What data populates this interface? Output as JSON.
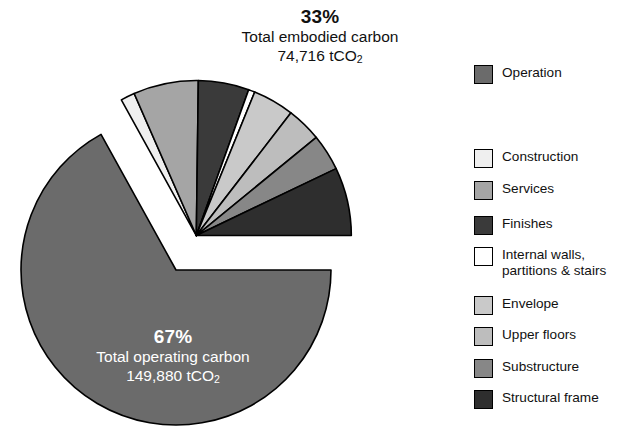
{
  "chart_data": {
    "type": "pie",
    "title": "",
    "subtitle": "",
    "xlabel": "",
    "ylabel": "",
    "grid": false,
    "legend_position": "right",
    "units": "tCO2",
    "groups": [
      {
        "name": "Total operating carbon",
        "percent_label": "67%",
        "percent": 67,
        "value_label": "149,880 tCO₂",
        "value": 149880,
        "exploded": false,
        "categories": [
          "Operation"
        ],
        "values": [
          149880
        ]
      },
      {
        "name": "Total embodied carbon",
        "percent_label": "33%",
        "percent": 33,
        "value_label": "74,716 tCO₂",
        "value": 74716,
        "exploded": true,
        "categories": [
          "Construction",
          "Services",
          "Finishes",
          "Internal walls, partitions & stairs",
          "Envelope",
          "Upper floors",
          "Substructure",
          "Structural frame"
        ],
        "values": [
          4.5,
          20.5,
          16.0,
          2.0,
          13.0,
          11.0,
          11.5,
          21.5
        ]
      }
    ],
    "slices": [
      {
        "label": "Operation",
        "percent_of_total": 67.0,
        "share_of_embodied": null,
        "color": "#6b6b6b",
        "sweep_deg": 241.2
      },
      {
        "label": "Construction",
        "percent_of_total": 1.5,
        "share_of_embodied": 4.5,
        "color": "#efefef",
        "sweep_deg": 5.3
      },
      {
        "label": "Services",
        "percent_of_total": 6.8,
        "share_of_embodied": 20.5,
        "color": "#a5a5a5",
        "sweep_deg": 24.4
      },
      {
        "label": "Finishes",
        "percent_of_total": 5.3,
        "share_of_embodied": 16.0,
        "color": "#3a3a3a",
        "sweep_deg": 19.0
      },
      {
        "label": "Internal walls, partitions & stairs",
        "percent_of_total": 0.7,
        "share_of_embodied": 2.0,
        "color": "#ffffff",
        "sweep_deg": 2.4
      },
      {
        "label": "Envelope",
        "percent_of_total": 4.3,
        "share_of_embodied": 13.0,
        "color": "#c9c9c9",
        "sweep_deg": 15.5
      },
      {
        "label": "Upper floors",
        "percent_of_total": 3.6,
        "share_of_embodied": 11.0,
        "color": "#bdbdbd",
        "sweep_deg": 13.1
      },
      {
        "label": "Substructure",
        "percent_of_total": 3.8,
        "share_of_embodied": 11.5,
        "color": "#878787",
        "sweep_deg": 13.7
      },
      {
        "label": "Structural frame",
        "percent_of_total": 7.1,
        "share_of_embodied": 21.5,
        "color": "#2e2e2e",
        "sweep_deg": 25.6
      }
    ]
  },
  "callouts": {
    "embodied": {
      "percent": "33%",
      "line1": "Total embodied carbon",
      "value_number": "74,716 tCO",
      "value_sub": "2"
    },
    "operating": {
      "percent": "67%",
      "line1": "Total operating carbon",
      "value_number": "149,880 tCO",
      "value_sub": "2"
    }
  },
  "legend": {
    "items": [
      {
        "label": "Operation",
        "color": "#6b6b6b",
        "top": 0,
        "two_line": false
      },
      {
        "label": "Construction",
        "color": "#efefef",
        "top": 84,
        "two_line": false
      },
      {
        "label": "Services",
        "color": "#a5a5a5",
        "top": 116,
        "two_line": false
      },
      {
        "label": "Finishes",
        "color": "#3a3a3a",
        "top": 151,
        "two_line": false
      },
      {
        "label": "Internal walls,\npartitions & stairs",
        "color": "#ffffff",
        "top": 182,
        "two_line": true
      },
      {
        "label": "Envelope",
        "color": "#c9c9c9",
        "top": 231,
        "two_line": false
      },
      {
        "label": "Upper floors",
        "color": "#bdbdbd",
        "top": 262,
        "two_line": false
      },
      {
        "label": "Substructure",
        "color": "#878787",
        "top": 294,
        "two_line": false
      },
      {
        "label": "Structural frame",
        "color": "#2e2e2e",
        "top": 325,
        "two_line": false
      }
    ]
  },
  "colors": {
    "background": "#ffffff",
    "outline": "#000000",
    "text": "#111111",
    "text_on_dark": "#ffffff"
  }
}
